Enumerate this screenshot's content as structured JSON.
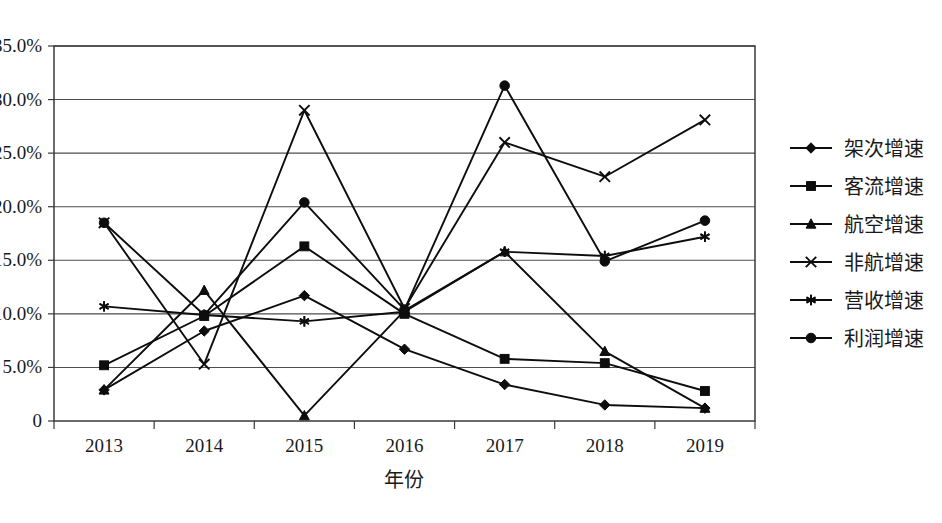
{
  "chart_data": {
    "type": "line",
    "title": "",
    "xlabel": "年份",
    "ylabel": "",
    "categories": [
      "2013",
      "2014",
      "2015",
      "2016",
      "2017",
      "2018",
      "2019"
    ],
    "ylim": [
      0,
      35
    ],
    "ytick_labels": [
      "0",
      "5.0%",
      "10.0%",
      "15.0%",
      "20.0%",
      "25.0%",
      "30.0%",
      "35.0%"
    ],
    "ytick_values": [
      0,
      5,
      10,
      15,
      20,
      25,
      30,
      35
    ],
    "grid": true,
    "legend_position": "right",
    "units": "percent",
    "series": [
      {
        "name": "架次增速",
        "marker": "diamond",
        "values": [
          2.9,
          8.4,
          11.7,
          6.7,
          3.4,
          1.5,
          1.2
        ]
      },
      {
        "name": "客流增速",
        "marker": "square",
        "values": [
          5.2,
          9.8,
          16.3,
          10.0,
          5.8,
          5.4,
          2.8
        ]
      },
      {
        "name": "航空增速",
        "marker": "triangle",
        "values": [
          2.9,
          12.2,
          0.5,
          10.3,
          15.8,
          6.5,
          1.2
        ]
      },
      {
        "name": "非航增速",
        "marker": "cross",
        "values": [
          18.5,
          5.3,
          29.0,
          10.5,
          26.0,
          22.8,
          28.1
        ]
      },
      {
        "name": "营收增速",
        "marker": "asterisk",
        "values": [
          10.7,
          9.9,
          9.3,
          10.2,
          15.8,
          15.4,
          17.2
        ]
      },
      {
        "name": "利润增速",
        "marker": "circle",
        "values": [
          18.5,
          9.9,
          20.4,
          10.4,
          31.3,
          14.9,
          18.7
        ]
      }
    ]
  },
  "legend": {
    "items": [
      {
        "label": "架次增速",
        "marker": "diamond"
      },
      {
        "label": "客流增速",
        "marker": "square"
      },
      {
        "label": "航空增速",
        "marker": "triangle"
      },
      {
        "label": "非航增速",
        "marker": "cross"
      },
      {
        "label": "营收增速",
        "marker": "asterisk"
      },
      {
        "label": "利润增速",
        "marker": "circle"
      }
    ]
  },
  "axes": {
    "x_title": "年份",
    "x_tick_labels": [
      "2013",
      "2014",
      "2015",
      "2016",
      "2017",
      "2018",
      "2019"
    ],
    "y_tick_labels": [
      "35.0%",
      "30.0%",
      "25.0%",
      "20.0%",
      "15.0%",
      "10.0%",
      "5.0%",
      "0"
    ]
  },
  "colors": {
    "series": "#0d0d0d",
    "grid": "#4d4d4d",
    "frame": "#3a3a3a",
    "text": "#1a1a1a",
    "background": "#ffffff"
  }
}
